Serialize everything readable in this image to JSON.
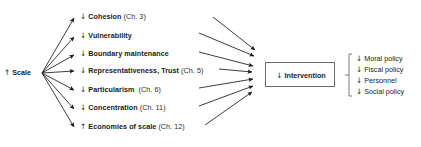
{
  "diagram": {
    "type": "causal-flow-diagram",
    "background": "#ffffff",
    "line_color": "#1a1a1a",
    "box_border_color": "#6b6b6b",
    "source": {
      "id": "scale",
      "arrow": "↑",
      "label": "Scale",
      "full_text": "↑ Scale"
    },
    "effects": [
      {
        "arrow": "↓",
        "term": "Cohesion",
        "chapter": "(Ch. 3)"
      },
      {
        "arrow": "↓",
        "term": "Vulnerability",
        "chapter": ""
      },
      {
        "arrow": "↓",
        "term": "Boundary maintenance",
        "chapter": ""
      },
      {
        "arrow": "↓",
        "term": "Representativeness, Trust",
        "chapter": "(Ch. 5)"
      },
      {
        "arrow": "↓",
        "term": "Particularism",
        "chapter": "(Ch. 6)"
      },
      {
        "arrow": "↓",
        "term": "Concentration",
        "chapter": "(Ch. 11)"
      },
      {
        "arrow": "↑",
        "term": "Economies of scale",
        "chapter": "(Ch. 12)"
      }
    ],
    "outcome": {
      "arrow": "↓",
      "label": "Intervention",
      "full_text": "↓ Intervention"
    },
    "outcome_details": [
      {
        "arrow": "↓",
        "label": "Moral policy"
      },
      {
        "arrow": "↓",
        "label": "Fiscal policy"
      },
      {
        "arrow": "↓",
        "label": "Personnel"
      },
      {
        "arrow": "↓",
        "label": "Social policy"
      }
    ]
  }
}
